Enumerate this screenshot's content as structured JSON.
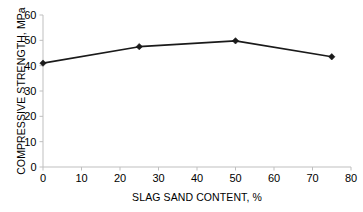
{
  "chart_data": {
    "type": "line",
    "title": "",
    "subtitle": "",
    "xlabel": "SLAG SAND CONTENT, %",
    "ylabel": "COMPRESSIVE STRENGTH, MPa",
    "x": [
      0,
      25,
      50,
      75
    ],
    "values": [
      41,
      47.5,
      49.8,
      43.5
    ],
    "series": [
      {
        "name": "Compressive strength",
        "x": [
          0,
          25,
          50,
          75
        ],
        "values": [
          41,
          47.5,
          49.8,
          43.5
        ]
      }
    ],
    "xlim": [
      0,
      80
    ],
    "ylim": [
      0,
      60
    ],
    "xticks": [
      0,
      10,
      20,
      30,
      40,
      50,
      60,
      70,
      80
    ],
    "yticks": [
      0,
      10,
      20,
      30,
      40,
      50,
      60
    ],
    "xtick_labels": [
      "0",
      "10",
      "20",
      "30",
      "40",
      "50",
      "60",
      "70",
      "80"
    ],
    "ytick_labels": [
      "0",
      "10",
      "20",
      "30",
      "40",
      "50",
      "60"
    ],
    "grid": false,
    "legend": false,
    "legend_position": "none",
    "annotations": [],
    "marker": "diamond",
    "line_color": "#1a1a1a",
    "marker_color": "#1a1a1a",
    "axis_color": "#bfbfbf",
    "background_color": "#ffffff",
    "text_color": "#000000"
  }
}
